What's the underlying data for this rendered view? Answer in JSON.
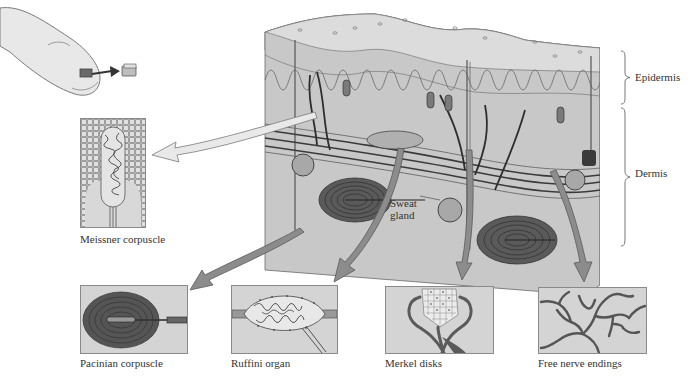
{
  "diagram": {
    "layers": {
      "epidermis": "Epidermis",
      "dermis": "Dermis"
    },
    "callouts": {
      "sweat_gland": "Sweat\ngland",
      "sweat_gland_line1": "Sweat",
      "sweat_gland_line2": "gland"
    },
    "receptors": [
      {
        "id": "meissner",
        "label": "Meissner corpuscle"
      },
      {
        "id": "pacinian",
        "label": "Pacinian corpuscle"
      },
      {
        "id": "ruffini",
        "label": "Ruffini organ"
      },
      {
        "id": "merkel",
        "label": "Merkel disks"
      },
      {
        "id": "free",
        "label": "Free nerve endings"
      }
    ],
    "colors": {
      "background": "#ffffff",
      "inset_fill": "#d4d4d4",
      "skin_top": "#e6e6e6",
      "skin_epidermis": "#cfcfcf",
      "skin_dermis": "#c4c4c4",
      "arrow_fill": "#8c8c8c",
      "nerve": "#3a3a3a",
      "text": "#333333"
    }
  }
}
